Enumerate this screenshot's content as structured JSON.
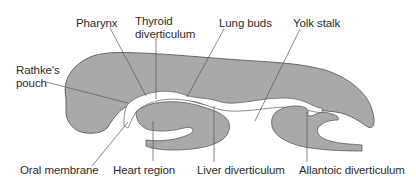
{
  "diagram": {
    "colors": {
      "tissue_fill": "#a9a9a9",
      "tissue_stroke": "#5a5a5a",
      "leader_line": "#555555",
      "lumen": "#ffffff",
      "text": "#2a2a2a"
    },
    "labels": {
      "pharynx": "Pharynx",
      "thyroid_line1": "Thyroid",
      "thyroid_line2": "diverticulum",
      "lung_buds": "Lung buds",
      "yolk_stalk": "Yolk stalk",
      "rathke_line1": "Rathke's",
      "rathke_line2": "pouch",
      "oral_membrane": "Oral membrane",
      "heart_region": "Heart region",
      "liver_diverticulum": "Liver diverticulum",
      "allantoic_diverticulum": "Allantoic diverticulum"
    }
  }
}
